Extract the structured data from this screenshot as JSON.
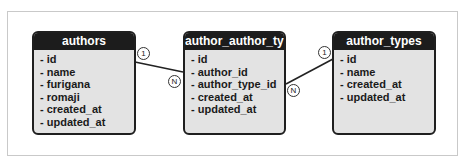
{
  "entities": [
    {
      "name": "authors",
      "fields": [
        "- id",
        "- name",
        "- furigana",
        "- romaji",
        "- created_at",
        "- updated_at"
      ]
    },
    {
      "name": "author_author_type",
      "fields": [
        "- id",
        "- author_id",
        "- author_type_id",
        "- created_at",
        "- updated_at"
      ]
    },
    {
      "name": "author_types",
      "fields": [
        "- id",
        "- name",
        "- created_at",
        "- updated_at"
      ]
    }
  ],
  "relations": [
    {
      "from": "authors",
      "to": "author_author_type",
      "from_cardinality": "1",
      "to_cardinality": "N"
    },
    {
      "from": "author_types",
      "to": "author_author_type",
      "from_cardinality": "1",
      "to_cardinality": "N"
    }
  ],
  "colors": {
    "header_bg": "#1c1c1c",
    "body_bg": "#e3e3e3",
    "border": "#1f1f1f",
    "line": "#222222"
  }
}
